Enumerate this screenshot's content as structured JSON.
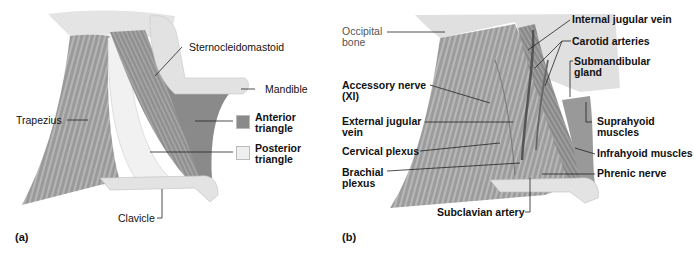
{
  "figure": {
    "panels": [
      {
        "id": "a",
        "tag": "(a)",
        "labels": {
          "sternocleidomastoid": "Sternocleidomastoid",
          "mandible": "Mandible",
          "trapezius": "Trapezius",
          "anterior_triangle": "Anterior\ntriangle",
          "posterior_triangle": "Posterior\ntriangle",
          "clavicle": "Clavicle"
        },
        "legend": [
          {
            "label": "Anterior triangle",
            "color": "#8a8a8a"
          },
          {
            "label": "Posterior triangle",
            "color": "#efefef"
          }
        ]
      },
      {
        "id": "b",
        "tag": "(b)",
        "labels": {
          "occipital_bone": "Occipital\nbone",
          "accessory_nerve": "Accessory nerve\n(XI)",
          "external_jugular_vein": "External jugular\nvein",
          "cervical_plexus": "Cervical plexus",
          "brachial_plexus": "Brachial\nplexus",
          "internal_jugular_vein": "Internal jugular vein",
          "carotid_arteries": "Carotid arteries",
          "submandibular_gland": "Submandibular\ngland",
          "suprahyoid_muscles": "Suprahyoid\nmuscles",
          "infrahyoid_muscles": "Infrahyoid muscles",
          "phrenic_nerve": "Phrenic nerve",
          "subclavian_artery": "Subclavian artery"
        }
      }
    ],
    "colors": {
      "muscle": "#9a9a9a",
      "muscle_dark": "#7d7d7d",
      "bone": "#e6e6e6",
      "anterior_fill": "#8a8a8a",
      "posterior_fill": "#efefef",
      "leader": "#222222"
    }
  }
}
